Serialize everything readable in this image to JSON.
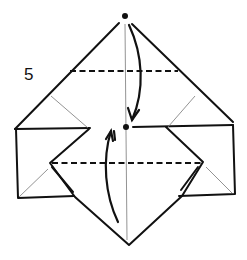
{
  "diagram": {
    "step_number": "5",
    "colors": {
      "line": "#111111",
      "thin_line": "#777777",
      "background": "#ffffff"
    },
    "elements": {
      "reference_dots": [
        {
          "name": "top-point-dot",
          "x": 125,
          "y": 16
        },
        {
          "name": "center-dot",
          "x": 126,
          "y": 127
        }
      ],
      "valley_folds": [
        {
          "name": "upper-valley-fold",
          "x1": 70,
          "y1": 71,
          "x2": 178,
          "y2": 71
        },
        {
          "name": "lower-valley-fold",
          "x1": 50,
          "y1": 163,
          "x2": 203,
          "y2": 163
        }
      ],
      "arrows": [
        {
          "name": "fold-down-arrow",
          "from": "top-point",
          "to": "center-dot"
        },
        {
          "name": "fold-up-arrow",
          "from": "bottom-point",
          "to": "center-dot"
        }
      ]
    }
  }
}
